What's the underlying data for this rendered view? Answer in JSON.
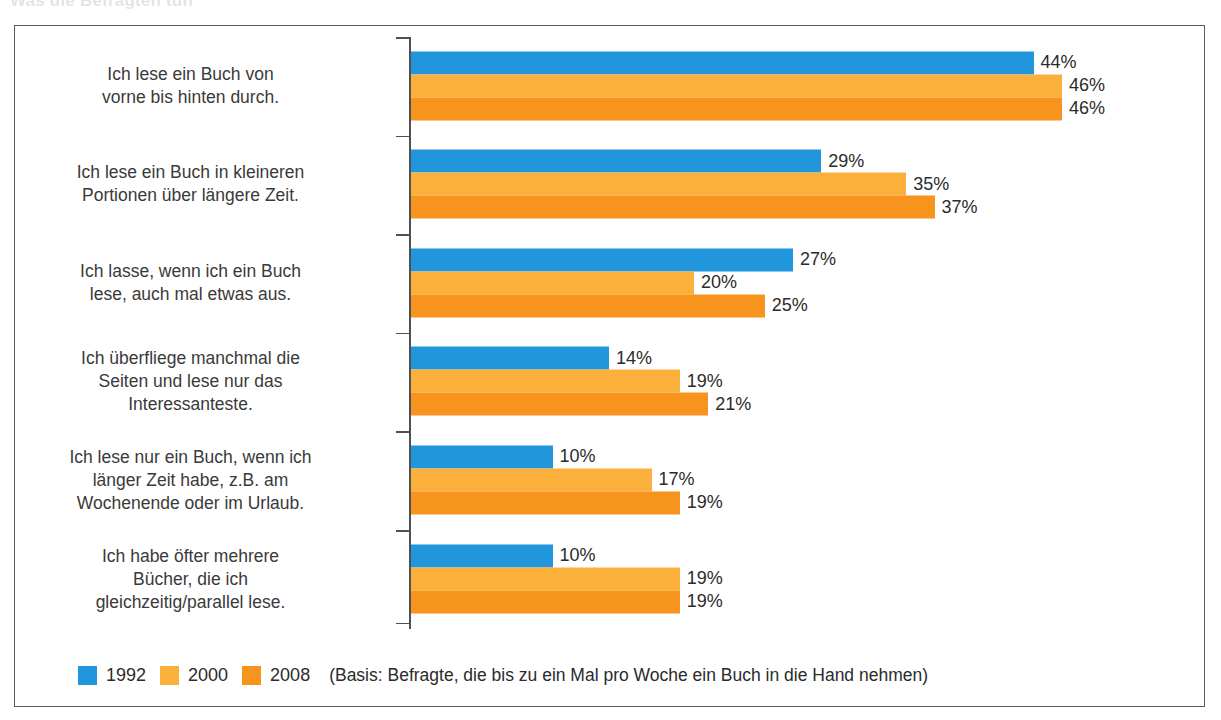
{
  "top_title_faint": "Was die Befragten tun",
  "chart_data": {
    "type": "bar",
    "orientation": "horizontal",
    "title": "",
    "xlabel": "",
    "ylabel": "",
    "xlim": [
      0,
      50
    ],
    "grid": false,
    "value_suffix": "%",
    "legend_position": "bottom-left",
    "categories": [
      "Ich lese ein Buch von\nvorne bis hinten durch.",
      "Ich lese ein Buch in kleineren\nPortionen über längere Zeit.",
      "Ich lasse, wenn ich ein Buch\nlese, auch mal etwas aus.",
      "Ich überfliege manchmal die\nSeiten und lese nur das\nInteressanteste.",
      "Ich lese nur ein Buch, wenn ich\nlänger Zeit habe, z.B. am\nWochenende oder im Urlaub.",
      "Ich habe öfter mehrere\nBücher, die ich\ngleichzeitig/parallel lese."
    ],
    "series": [
      {
        "name": "1992",
        "color": "#2196dd",
        "values": [
          44,
          29,
          27,
          14,
          10,
          10
        ]
      },
      {
        "name": "2000",
        "color": "#fbb03c",
        "values": [
          46,
          35,
          20,
          19,
          17,
          19
        ]
      },
      {
        "name": "2008",
        "color": "#f7941e",
        "values": [
          46,
          37,
          25,
          21,
          19,
          19
        ]
      }
    ],
    "value_labels": [
      [
        "44%",
        "46%",
        "46%"
      ],
      [
        "29%",
        "35%",
        "37%"
      ],
      [
        "27%",
        "20%",
        "25%"
      ],
      [
        "14%",
        "19%",
        "21%"
      ],
      [
        "10%",
        "17%",
        "19%"
      ],
      [
        "10%",
        "19%",
        "19%"
      ]
    ]
  },
  "rows": [
    {
      "label_line1": "Ich lese ein Buch von",
      "label_line2": "vorne bis hinten durch.",
      "label_line3": ""
    },
    {
      "label_line1": "Ich lese ein Buch in kleineren",
      "label_line2": "Portionen über längere Zeit.",
      "label_line3": ""
    },
    {
      "label_line1": "Ich lasse, wenn ich ein Buch",
      "label_line2": "lese, auch mal etwas aus.",
      "label_line3": ""
    },
    {
      "label_line1": "Ich überfliege manchmal die",
      "label_line2": "Seiten und lese nur das",
      "label_line3": "Interessanteste."
    },
    {
      "label_line1": "Ich lese nur ein Buch, wenn ich",
      "label_line2": "länger Zeit habe, z.B. am",
      "label_line3": "Wochenende oder im Urlaub."
    },
    {
      "label_line1": "Ich habe öfter mehrere",
      "label_line2": "Bücher, die ich",
      "label_line3": "gleichzeitig/parallel lese."
    }
  ],
  "legend": {
    "items": [
      {
        "label": "1992",
        "color": "#2196dd"
      },
      {
        "label": "2000",
        "color": "#fbb03c"
      },
      {
        "label": "2008",
        "color": "#f7941e"
      }
    ],
    "note": "(Basis: Befragte, die bis zu ein Mal pro Woche ein Buch in die Hand nehmen)"
  },
  "colors": {
    "series_1992": "#2196dd",
    "series_2000": "#fbb03c",
    "series_2008": "#f7941e",
    "frame": "#585c60",
    "text": "#2b2b2b",
    "background": "#ffffff"
  }
}
